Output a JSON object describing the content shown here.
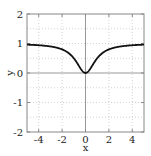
{
  "chart_data": {
    "type": "line",
    "title": "",
    "xlabel": "x",
    "ylabel": "y",
    "xlim": [
      -5,
      5
    ],
    "ylim": [
      -2,
      2
    ],
    "xticks": [
      -4,
      -2,
      0,
      2,
      4
    ],
    "yticks": [
      -2,
      -1,
      0,
      1,
      2
    ],
    "grid": true,
    "legend": null,
    "series": [
      {
        "name": "y = x^2/(1+x^2)",
        "x": [
          -5,
          -4,
          -3,
          -2.5,
          -2,
          -1.5,
          -1,
          -0.75,
          -0.5,
          -0.25,
          0,
          0.25,
          0.5,
          0.75,
          1,
          1.5,
          2,
          2.5,
          3,
          4,
          5
        ],
        "y": [
          0.96,
          0.94,
          0.9,
          0.86,
          0.8,
          0.69,
          0.5,
          0.36,
          0.2,
          0.06,
          0.0,
          0.06,
          0.2,
          0.36,
          0.5,
          0.69,
          0.8,
          0.86,
          0.9,
          0.94,
          0.96
        ]
      }
    ]
  },
  "labels": {
    "x_axis": "x",
    "y_axis": "y",
    "xtick_labels": [
      "-4",
      "-2",
      "0",
      "2",
      "4"
    ],
    "ytick_labels": [
      "2",
      "1",
      "0",
      "-1",
      "-2"
    ]
  },
  "colors": {
    "curve": "#111111",
    "frame": "#888888",
    "zero_axis": "#999999",
    "grid": "#c8c8c8"
  }
}
